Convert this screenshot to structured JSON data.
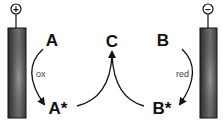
{
  "diagram": {
    "anode": {
      "terminal_symbol": "+",
      "polarity": "positive"
    },
    "cathode": {
      "terminal_symbol": "−",
      "polarity": "negative"
    },
    "species": {
      "A": "A",
      "A_star": "A*",
      "B": "B",
      "B_star": "B*",
      "C": "C"
    },
    "process_labels": {
      "oxidation": "ox",
      "reduction": "red"
    },
    "colors": {
      "electrode_dark": "#2a2a2a",
      "electrode_light": "#8a8a8a",
      "line": "#111111"
    }
  }
}
